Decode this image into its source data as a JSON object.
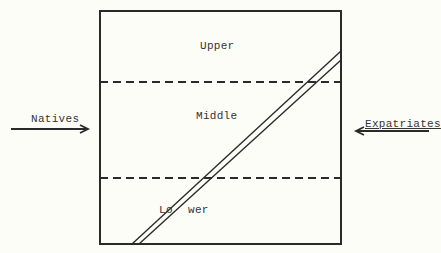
{
  "diagram": {
    "strata": {
      "upper": "Upper",
      "middle": "Middle",
      "lower_left": "Lo",
      "lower_right": "wer"
    },
    "arrows": {
      "left": "Natives",
      "right": "Expatriates"
    },
    "colors": {
      "ink": "#2a2a2a",
      "background": "#fdfdf8"
    }
  }
}
